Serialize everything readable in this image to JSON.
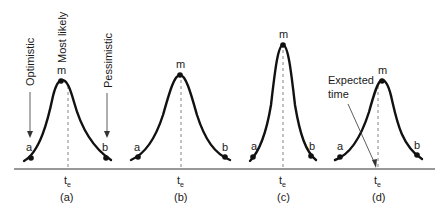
{
  "figure": {
    "background": "#ffffff",
    "ink": "#111111",
    "baseline_y": 169,
    "panels": [
      {
        "id": "a",
        "caption": "(a)",
        "te_label": "t",
        "te_sub": "e",
        "a_label": "a",
        "m_label": "m",
        "b_label": "b",
        "a_pt": [
          31,
          158
        ],
        "m_pt": [
          61,
          81
        ],
        "b_pt": [
          106,
          158
        ],
        "te_x": 68,
        "shape": "right-skewed"
      },
      {
        "id": "b",
        "caption": "(b)",
        "te_label": "t",
        "te_sub": "e",
        "a_label": "a",
        "m_label": "m",
        "b_label": "b",
        "a_pt": [
          138,
          157
        ],
        "m_pt": [
          180,
          75
        ],
        "b_pt": [
          225,
          157
        ],
        "te_x": 181,
        "shape": "symmetric"
      },
      {
        "id": "c",
        "caption": "(c)",
        "te_label": "t",
        "te_sub": "e",
        "a_label": "a",
        "m_label": "m",
        "b_label": "b",
        "a_pt": [
          253,
          157
        ],
        "m_pt": [
          283,
          45
        ],
        "b_pt": [
          311,
          156
        ],
        "te_x": 283,
        "shape": "symmetric-narrow"
      },
      {
        "id": "d",
        "caption": "(d)",
        "te_label": "t",
        "te_sub": "e",
        "a_label": "a",
        "m_label": "m",
        "b_label": "b",
        "a_pt": [
          340,
          157
        ],
        "m_pt": [
          382,
          81
        ],
        "b_pt": [
          417,
          155
        ],
        "te_x": 378,
        "shape": "left-skewed"
      }
    ],
    "annotations": {
      "optimistic": "Optimistic",
      "most_likely": "Most likely",
      "pessimistic": "Pessimistic",
      "expected_line1": "Expected",
      "expected_line2": "time"
    }
  }
}
